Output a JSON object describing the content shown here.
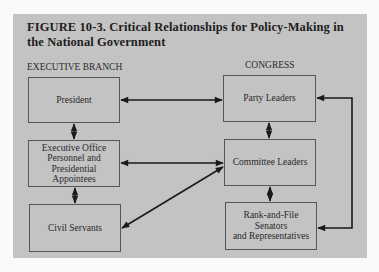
{
  "figure": {
    "title": "FIGURE 10-3. Critical Relationships for Policy-Making in the National Government"
  },
  "sections": {
    "executive": "EXECUTIVE BRANCH",
    "congress": "CONGRESS"
  },
  "nodes": {
    "president": "President",
    "executive_office": "Executive Office\nPersonnel and\nPresidential\nAppointees",
    "civil_servants": "Civil Servants",
    "party_leaders": "Party Leaders",
    "committee_leaders": "Committee Leaders",
    "rank_and_file": "Rank-and-File\nSenators\nand Representatives"
  },
  "edges": [
    {
      "from": "President",
      "to": "Party Leaders",
      "type": "bidirectional"
    },
    {
      "from": "President",
      "to": "Executive Office Personnel and Presidential Appointees",
      "type": "bidirectional"
    },
    {
      "from": "Executive Office Personnel and Presidential Appointees",
      "to": "Civil Servants",
      "type": "bidirectional"
    },
    {
      "from": "Executive Office Personnel and Presidential Appointees",
      "to": "Committee Leaders",
      "type": "bidirectional"
    },
    {
      "from": "Civil Servants",
      "to": "Committee Leaders",
      "type": "bidirectional"
    },
    {
      "from": "Party Leaders",
      "to": "Committee Leaders",
      "type": "bidirectional"
    },
    {
      "from": "Committee Leaders",
      "to": "Rank-and-File Senators and Representatives",
      "type": "bidirectional"
    },
    {
      "from": "Party Leaders",
      "to": "Rank-and-File Senators and Representatives",
      "type": "bidirectional"
    }
  ],
  "colors": {
    "panel": "#c3c3c3",
    "line": "#1a1a1a",
    "box_border": "#555555"
  }
}
